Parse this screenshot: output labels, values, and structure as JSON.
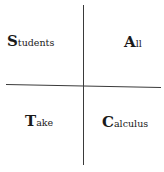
{
  "diagram": {
    "type": "quadrant-mnemonic",
    "quadrants": {
      "top_left": {
        "initial": "S",
        "rest": "tudents"
      },
      "top_right": {
        "initial": "A",
        "rest": "ll"
      },
      "bottom_left": {
        "initial": "T",
        "rest": "ake"
      },
      "bottom_right": {
        "initial": "C",
        "rest": "alculus"
      }
    },
    "line_color": "#3a3a3a",
    "text_color": "#1a1a1a"
  }
}
